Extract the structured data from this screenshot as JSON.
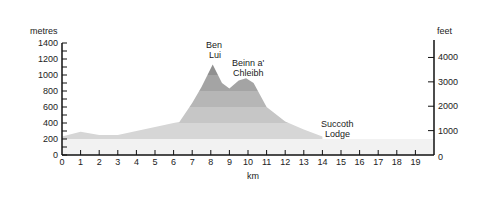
{
  "chart_data": {
    "type": "area",
    "title": "",
    "xlabel": "km",
    "ylabel_left": "metres",
    "ylabel_right": "feet",
    "xlim": [
      0,
      20
    ],
    "ylim": [
      0,
      1400
    ],
    "x_ticks": [
      "0",
      "1",
      "2",
      "3",
      "4",
      "5",
      "6",
      "7",
      "8",
      "9",
      "10",
      "11",
      "12",
      "13",
      "14",
      "15",
      "16",
      "17",
      "18",
      "19"
    ],
    "y_ticks_left": [
      "0",
      "200",
      "400",
      "600",
      "800",
      "1000",
      "1200",
      "1400"
    ],
    "y_ticks_right": [
      "0",
      "1000",
      "2000",
      "3000",
      "4000"
    ],
    "grid": false,
    "x": [
      0,
      1,
      2,
      3,
      4,
      5,
      6,
      6.3,
      7,
      7.5,
      8.1,
      8.6,
      9,
      9.5,
      9.9,
      10.3,
      11,
      12,
      13,
      14
    ],
    "elevation_m": [
      230,
      290,
      250,
      250,
      300,
      350,
      400,
      410,
      650,
      850,
      1130,
      900,
      830,
      930,
      960,
      900,
      600,
      420,
      320,
      230
    ],
    "annotations": [
      {
        "label": "Ben Lui",
        "x": 8.1,
        "y": 1130
      },
      {
        "label": "Beinn a' Chleibh",
        "x": 9.9,
        "y": 916
      },
      {
        "label": "Succoth Lodge",
        "x": 14,
        "y": 230
      }
    ]
  },
  "labels": {
    "metres": "metres",
    "feet": "feet",
    "km": "km",
    "ben": "Ben",
    "lui": "Lui",
    "beinn": "Beinn a'",
    "chleibh": "Chleibh",
    "succoth": "Succoth",
    "lodge": "Lodge"
  }
}
